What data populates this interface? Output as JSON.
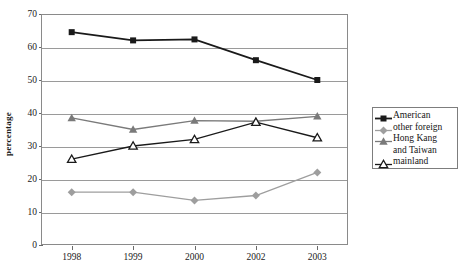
{
  "chart_data": {
    "type": "line",
    "title": "",
    "xlabel": "",
    "ylabel": "percentage",
    "categories": [
      "1998",
      "1999",
      "2000",
      "2002",
      "2003"
    ],
    "ylim": [
      0,
      70
    ],
    "ytick_step": 10,
    "yticks": [
      "0",
      "10",
      "20",
      "30",
      "40",
      "50",
      "60",
      "70"
    ],
    "grid": true,
    "legend_position": "right",
    "series": [
      {
        "name": "American",
        "marker": "filled-square",
        "color": "#1a1a1a",
        "values": [
          64.5,
          62.0,
          62.3,
          56.0,
          50.0
        ]
      },
      {
        "name": "other foreign",
        "marker": "filled-diamond",
        "color": "#9e9e9e",
        "values": [
          16.0,
          16.0,
          13.5,
          15.0,
          22.0
        ]
      },
      {
        "name": "Hong Kang and Taiwan",
        "marker": "filled-triangle",
        "color": "#7a7a7a",
        "values": [
          38.5,
          35.0,
          37.7,
          37.5,
          39.0
        ]
      },
      {
        "name": "mainland",
        "marker": "open-triangle",
        "color": "#1a1a1a",
        "values": [
          26.0,
          30.0,
          32.0,
          37.2,
          32.5
        ]
      }
    ]
  },
  "legend": {
    "entries": [
      {
        "label": "American",
        "label2": ""
      },
      {
        "label": "other foreign",
        "label2": ""
      },
      {
        "label": "Hong Kang",
        "label2": "and Taiwan"
      },
      {
        "label": "mainland",
        "label2": ""
      }
    ]
  }
}
